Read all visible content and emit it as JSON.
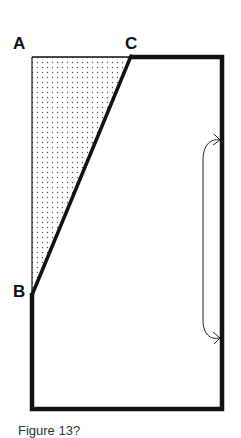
{
  "figure": {
    "type": "geometric-diagram",
    "points": {
      "A": {
        "label": "A",
        "position": "top-left corner"
      },
      "B": {
        "label": "B",
        "position": "on left edge, lower"
      },
      "C": {
        "label": "C",
        "position": "on top edge"
      }
    },
    "shaded_region": {
      "shape": "triangle",
      "vertices": [
        "A",
        "B",
        "C"
      ],
      "fill_pattern": "dotted"
    },
    "right_bracket": {
      "style": "curved double-headed arrow",
      "span": "middle portion of right edge"
    },
    "caption": "Figure 13?"
  },
  "colors": {
    "line": "#111111",
    "background": "#ffffff",
    "dots": "#555555"
  }
}
